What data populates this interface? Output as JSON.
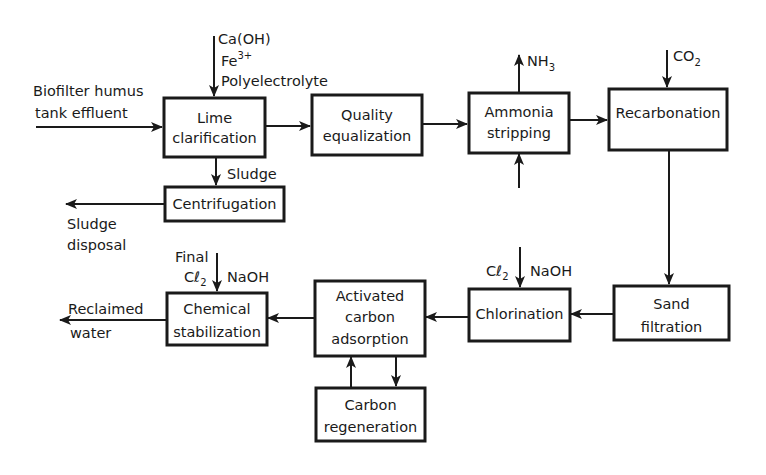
{
  "diagram": {
    "title": "",
    "colors": {
      "ink": "#1a1a1a",
      "background": "#ffffff"
    },
    "boxes": {
      "lime": {
        "lines": [
          "Lime",
          "clarification"
        ]
      },
      "centrifugation": {
        "lines": [
          "Centrifugation"
        ]
      },
      "quality": {
        "lines": [
          "Quality",
          "equalization"
        ]
      },
      "ammonia": {
        "lines": [
          "Ammonia",
          "stripping"
        ]
      },
      "recarbonation": {
        "lines": [
          "Recarbonation"
        ]
      },
      "sand": {
        "lines": [
          "Sand",
          "filtration"
        ]
      },
      "chlorination": {
        "lines": [
          "Chlorination"
        ]
      },
      "carbon_adsorption": {
        "lines": [
          "Activated",
          "carbon",
          "adsorption"
        ]
      },
      "carbon_regeneration": {
        "lines": [
          "Carbon",
          "regeneration"
        ]
      },
      "chemical_stabilization": {
        "lines": [
          "Chemical",
          "stabilization"
        ]
      }
    },
    "labels": {
      "influent": [
        "Biofilter humus",
        "tank effluent"
      ],
      "lime_inputs": {
        "caoh": "Ca(OH)",
        "fe": "Fe",
        "fe_sup": "3+",
        "poly": "Polyelectrolyte"
      },
      "sludge": "Sludge",
      "sludge_disposal": [
        "Sludge",
        "disposal"
      ],
      "nh3": {
        "base": "NH",
        "sub": "3"
      },
      "co2": {
        "base": "CO",
        "sub": "2"
      },
      "chlorination_inputs": {
        "cl": "Cℓ",
        "cl_sub": "2",
        "naoh": "NaOH"
      },
      "stabilization_inputs": {
        "final": "Final",
        "cl": "Cℓ",
        "cl_sub": "2",
        "naoh": "NaOH"
      },
      "reclaimed": [
        "Reclaimed",
        "water"
      ]
    }
  }
}
